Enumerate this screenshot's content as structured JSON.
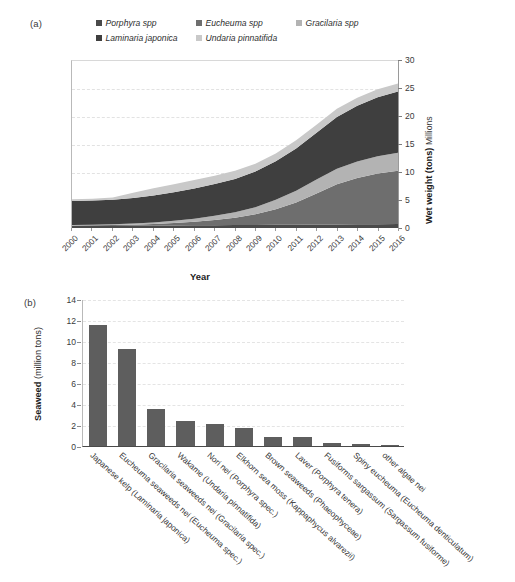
{
  "figure": {
    "panel_a_tag": "(a)",
    "panel_b_tag": "(b)"
  },
  "panel_a": {
    "legend": [
      {
        "label": "Porphyra spp",
        "color": "#4a4a4a"
      },
      {
        "label": "Eucheuma spp",
        "color": "#6e6e6e"
      },
      {
        "label": "Gracilaria spp",
        "color": "#b3b3b3"
      },
      {
        "label": "Laminaria japonica",
        "color": "#3f3f3f"
      },
      {
        "label": "Undaria pinnatifida",
        "color": "#c9c9c9"
      }
    ],
    "x_title": "Year",
    "y_title_bold": "Wet weight (tons)",
    "y_title_light": "Millions",
    "y_ticks": [
      "0",
      "5",
      "10",
      "15",
      "20",
      "25",
      "30"
    ],
    "x_ticks": [
      "2000",
      "2001",
      "2002",
      "2003",
      "2004",
      "2005",
      "2006",
      "2007",
      "2008",
      "2009",
      "2010",
      "2011",
      "2012",
      "2013",
      "2014",
      "2015",
      "2016"
    ]
  },
  "panel_b": {
    "y_title_bold": "Seaweed",
    "y_title_light": "(million tons)",
    "y_ticks": [
      "0",
      "2",
      "4",
      "6",
      "8",
      "10",
      "12",
      "14"
    ],
    "categories": [
      "Japanese kelp (Laminaria japonica)",
      "Eucheuma seaweeds nei (Eucheuma spec.)",
      "Gracilaria seaweeds nei (Gracilaria spec.)",
      "Wakame (Undaria pinnatifida)",
      "Nori nei (Porphyra spec.)",
      "Elkhorn sea moss (Kappaphycus alvarezii)",
      "Brown seaweeds (Phaeophyceae)",
      "Laver (Porphyra tenera)",
      "Fusiforms sargassum (Sargassum fusiforme)",
      "Spiny eucheuma (Eucheuma denticulatum)",
      "other algae nei"
    ]
  },
  "chart_data": [
    {
      "type": "area",
      "title": "",
      "panel": "(a)",
      "stacked": true,
      "xlabel": "Year",
      "ylabel": "Wet weight (tons) Millions",
      "ylim": [
        0,
        30
      ],
      "xlim": [
        2000,
        2016
      ],
      "grid": true,
      "legend_position": "top",
      "x": [
        2000,
        2001,
        2002,
        2003,
        2004,
        2005,
        2006,
        2007,
        2008,
        2009,
        2010,
        2011,
        2012,
        2013,
        2014,
        2015,
        2016
      ],
      "series": [
        {
          "name": "Porphyra spp",
          "color": "#4a4a4a",
          "values": [
            0.35,
            0.36,
            0.38,
            0.4,
            0.42,
            0.45,
            0.48,
            0.5,
            0.52,
            0.55,
            0.58,
            0.6,
            0.62,
            0.65,
            0.66,
            0.68,
            0.7
          ]
        },
        {
          "name": "Eucheuma spp",
          "color": "#6e6e6e",
          "values": [
            0.1,
            0.12,
            0.15,
            0.2,
            0.3,
            0.45,
            0.65,
            0.95,
            1.3,
            1.9,
            2.8,
            4.0,
            5.6,
            7.2,
            8.3,
            9.1,
            9.6
          ]
        },
        {
          "name": "Gracilaria spp",
          "color": "#b3b3b3",
          "values": [
            0.1,
            0.12,
            0.15,
            0.2,
            0.28,
            0.4,
            0.55,
            0.75,
            1.0,
            1.3,
            1.7,
            2.1,
            2.5,
            2.8,
            3.0,
            3.1,
            3.2
          ]
        },
        {
          "name": "Laminaria japonica",
          "color": "#3f3f3f",
          "values": [
            4.3,
            4.35,
            4.4,
            4.6,
            4.85,
            5.1,
            5.4,
            5.7,
            6.0,
            6.4,
            6.9,
            7.6,
            8.4,
            9.3,
            10.0,
            10.6,
            11.0
          ]
        },
        {
          "name": "Undaria pinnatifida",
          "color": "#c9c9c9",
          "values": [
            0.3,
            0.32,
            0.4,
            0.95,
            1.3,
            1.45,
            1.55,
            1.5,
            1.45,
            1.4,
            1.4,
            1.45,
            1.45,
            1.45,
            1.45,
            1.45,
            1.45
          ]
        }
      ],
      "totals": [
        5.15,
        5.27,
        5.48,
        6.35,
        7.15,
        7.85,
        8.63,
        9.4,
        10.27,
        11.55,
        13.38,
        15.75,
        18.57,
        21.4,
        23.41,
        24.93,
        25.95
      ]
    },
    {
      "type": "bar",
      "panel": "(b)",
      "title": "",
      "xlabel": "",
      "ylabel": "Seaweed (million tons)",
      "ylim": [
        0,
        14
      ],
      "grid": true,
      "bar_color": "#5e5e5e",
      "categories": [
        "Japanese kelp (Laminaria japonica)",
        "Eucheuma seaweeds nei (Eucheuma spec.)",
        "Gracilaria seaweeds nei (Gracilaria spec.)",
        "Wakame (Undaria pinnatifida)",
        "Nori nei (Porphyra spec.)",
        "Elkhorn sea moss (Kappaphycus alvarezii)",
        "Brown seaweeds (Phaeophyceae)",
        "Laver (Porphyra tenera)",
        "Fusiforms sargassum (Sargassum fusiforme)",
        "Spiny eucheuma (Eucheuma denticulatum)",
        "other algae nei"
      ],
      "values": [
        11.5,
        9.25,
        3.5,
        2.4,
        2.1,
        1.7,
        0.9,
        0.9,
        0.3,
        0.15,
        0.12
      ]
    }
  ]
}
